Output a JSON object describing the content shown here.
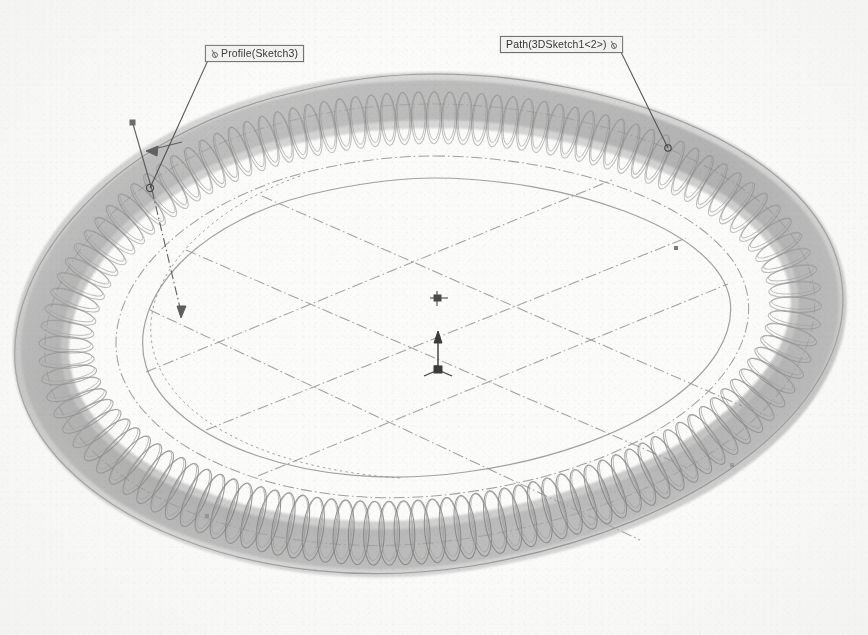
{
  "view": {
    "app": "CAD 3D viewport",
    "background_color": "#fbfbfa",
    "ink_color": "#7d7d7d",
    "centerline_color": "#8d8d8d",
    "label_border_color": "#6e6e6e",
    "label_fill_color": "#f3f3f1",
    "width": 868,
    "height": 635
  },
  "callouts": [
    {
      "id": "profile",
      "label": "Profile(Sketch3)",
      "anchor_icon": "sweep-profile-anchor-icon",
      "anchor_side": "left",
      "box": {
        "x": 205,
        "y": 45
      },
      "leader_to": {
        "x": 150,
        "y": 188
      }
    },
    {
      "id": "path",
      "label": "Path(3DSketch1<2>)",
      "anchor_icon": "sweep-path-anchor-icon",
      "anchor_side": "right",
      "box": {
        "x": 500,
        "y": 36
      },
      "leader_to": {
        "x": 668,
        "y": 148
      }
    }
  ],
  "geometry": {
    "model_name": "swept-helical-coil-torus",
    "description": "Helical coil swept along a closed rounded-rectangular 3D path",
    "coil_turns": 120,
    "origin_marker": {
      "x": 438,
      "y": 370,
      "axis": "vertical-up"
    },
    "profile_axis_marker": {
      "x": 133,
      "y": 122
    },
    "construction_lines": "dash-dot centerlines forming a diamond/cross grid"
  }
}
